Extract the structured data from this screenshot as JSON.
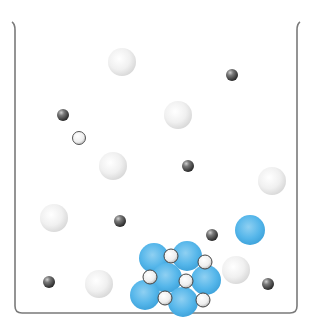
{
  "diagram": {
    "type": "beaker-dissolution",
    "colors": {
      "beaker": "#7a7a7a",
      "large_white": "#ececec",
      "small_dark": "#4a4a4a",
      "small_white": "#f2f2f2",
      "blue": "#4fb3e8"
    },
    "beaker": {
      "left": 14,
      "right": 298,
      "top": 22,
      "bottom": 313
    },
    "free_particles": [
      {
        "kind": "large_white",
        "x": 122,
        "y": 62,
        "r": 14
      },
      {
        "kind": "small_dark",
        "x": 232,
        "y": 75,
        "r": 6
      },
      {
        "kind": "small_dark",
        "x": 63,
        "y": 115,
        "r": 6
      },
      {
        "kind": "large_white",
        "x": 178,
        "y": 115,
        "r": 14
      },
      {
        "kind": "small_white",
        "x": 79,
        "y": 138,
        "r": 6.5
      },
      {
        "kind": "large_white",
        "x": 113,
        "y": 166,
        "r": 14
      },
      {
        "kind": "small_dark",
        "x": 188,
        "y": 166,
        "r": 6
      },
      {
        "kind": "large_white",
        "x": 272,
        "y": 181,
        "r": 14
      },
      {
        "kind": "large_white",
        "x": 54,
        "y": 218,
        "r": 14
      },
      {
        "kind": "small_dark",
        "x": 120,
        "y": 221,
        "r": 6
      },
      {
        "kind": "small_dark",
        "x": 212,
        "y": 235,
        "r": 6
      },
      {
        "kind": "blue",
        "x": 250,
        "y": 230,
        "r": 15
      },
      {
        "kind": "large_white",
        "x": 236,
        "y": 270,
        "r": 14
      },
      {
        "kind": "small_dark",
        "x": 49,
        "y": 282,
        "r": 6
      },
      {
        "kind": "large_white",
        "x": 99,
        "y": 284,
        "r": 14
      },
      {
        "kind": "small_dark",
        "x": 268,
        "y": 284,
        "r": 6
      }
    ],
    "lattice": {
      "blue": [
        {
          "x": 154,
          "y": 258,
          "r": 15
        },
        {
          "x": 187,
          "y": 256,
          "r": 15
        },
        {
          "x": 167,
          "y": 278,
          "r": 15
        },
        {
          "x": 206,
          "y": 280,
          "r": 15
        },
        {
          "x": 145,
          "y": 295,
          "r": 15
        },
        {
          "x": 183,
          "y": 302,
          "r": 15
        }
      ],
      "white": [
        {
          "x": 171,
          "y": 256,
          "r": 7
        },
        {
          "x": 205,
          "y": 262,
          "r": 7
        },
        {
          "x": 150,
          "y": 277,
          "r": 7
        },
        {
          "x": 186,
          "y": 281,
          "r": 7
        },
        {
          "x": 165,
          "y": 298,
          "r": 7
        },
        {
          "x": 203,
          "y": 300,
          "r": 7
        }
      ]
    }
  }
}
